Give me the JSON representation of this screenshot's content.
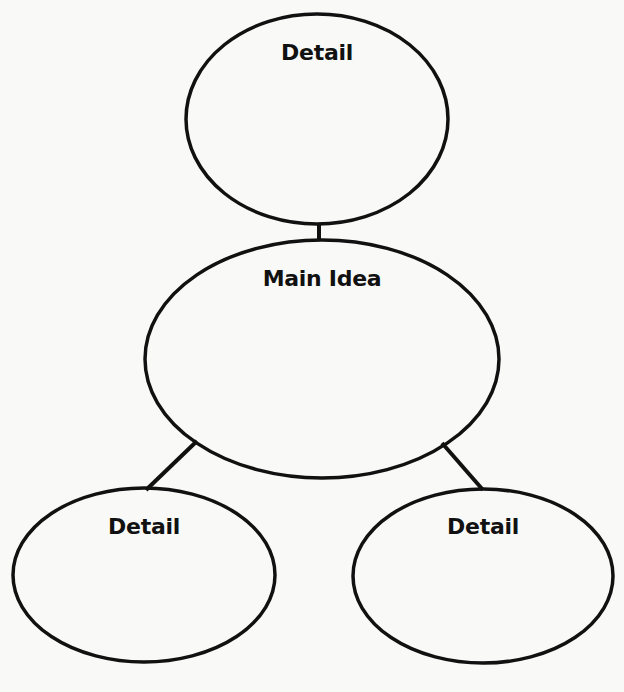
{
  "diagram": {
    "type": "main-idea-detail-web",
    "stroke_color": "#111111",
    "background_color": "#f9f9f8",
    "nodes": [
      {
        "id": "top-detail",
        "label": "Detail",
        "cx": 317,
        "cy": 119,
        "rx": 131,
        "ry": 105,
        "label_y": 42
      },
      {
        "id": "main-idea",
        "label": "Main Idea",
        "cx": 322,
        "cy": 359,
        "rx": 177,
        "ry": 119,
        "label_y": 268
      },
      {
        "id": "bottom-left-detail",
        "label": "Detail",
        "cx": 144,
        "cy": 575,
        "rx": 131,
        "ry": 87,
        "label_y": 516
      },
      {
        "id": "bottom-right-detail",
        "label": "Detail",
        "cx": 483,
        "cy": 576,
        "rx": 130,
        "ry": 87,
        "label_y": 516
      }
    ],
    "edges": [
      {
        "from": "top-detail",
        "to": "main-idea",
        "x1": 319,
        "y1": 223,
        "x2": 319,
        "y2": 241
      },
      {
        "from": "main-idea",
        "to": "bottom-left-detail",
        "x1": 197,
        "y1": 441,
        "x2": 146,
        "y2": 490
      },
      {
        "from": "main-idea",
        "to": "bottom-right-detail",
        "x1": 442,
        "y1": 443,
        "x2": 483,
        "y2": 490
      }
    ]
  }
}
